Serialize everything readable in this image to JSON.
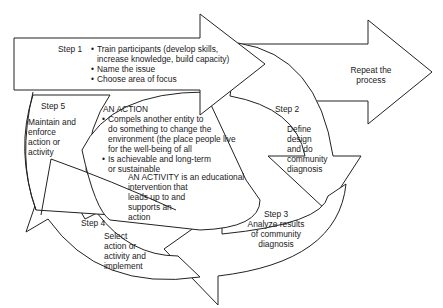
{
  "diagram": {
    "step1": {
      "label": "Step 1",
      "bullets": [
        "Train participants (develop skills,",
        "increase knowledge, build capacity)",
        "Name the issue",
        "Choose area of focus"
      ]
    },
    "repeat": {
      "line1": "Repeat the",
      "line2": "process"
    },
    "step2": {
      "label": "Step 2",
      "lines": [
        "Define",
        "design",
        "and do",
        "community",
        "diagnosis"
      ]
    },
    "step3": {
      "label": "Step 3",
      "lines": [
        "Analyze results",
        "of community",
        "diagnosis"
      ]
    },
    "step4": {
      "label": "Step 4",
      "lines": [
        "Select",
        "action or",
        "activity and",
        "implement"
      ]
    },
    "step5": {
      "label": "Step 5",
      "lines": [
        "Maintain and",
        "enforce",
        "action or",
        "activity"
      ]
    },
    "action": {
      "title": "AN ACTION",
      "bullet1": [
        "Compels another entity to",
        "do something to change the",
        "environment (the place people live",
        "for the well-being of all"
      ],
      "bullet2": [
        "Is achievable and long-term",
        "or sustainable"
      ]
    },
    "activity": {
      "lines": [
        "AN ACTIVITY is an educational",
        "intervention that",
        "leads up to and",
        "supports an",
        "action"
      ]
    }
  }
}
